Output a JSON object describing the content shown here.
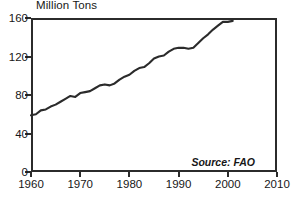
{
  "chart_data": {
    "type": "line",
    "title": "Million Tons",
    "xlabel": "",
    "ylabel": "Million Tons",
    "xlim": [
      1960,
      2010
    ],
    "ylim": [
      0,
      160
    ],
    "grid": false,
    "legend": null,
    "annotations": [
      {
        "name": "source",
        "text": "Source: FAO",
        "position": "bottom-right",
        "style": "italic"
      }
    ],
    "xticks": [
      1960,
      1970,
      1980,
      1990,
      2000,
      2010
    ],
    "yticks": [
      0,
      40,
      80,
      120,
      160
    ],
    "xtick_labels": [
      "1960",
      "1970",
      "1980",
      "1990",
      "2000",
      "2010"
    ],
    "ytick_labels": [
      "0",
      "40",
      "80",
      "120",
      "160"
    ],
    "series": [
      {
        "name": "World Fish Catch",
        "color": "#2b2b2b",
        "x": [
          1960,
          1961,
          1962,
          1963,
          1964,
          1965,
          1966,
          1967,
          1968,
          1969,
          1970,
          1971,
          1972,
          1973,
          1974,
          1975,
          1976,
          1977,
          1978,
          1979,
          1980,
          1981,
          1982,
          1983,
          1984,
          1985,
          1986,
          1987,
          1988,
          1989,
          1990,
          1991,
          1992,
          1993,
          1994,
          1995,
          1996,
          1997,
          1998,
          1999,
          2000,
          2001
        ],
        "values": [
          59,
          60,
          64,
          65,
          68,
          70,
          73,
          76,
          79,
          78,
          82,
          83,
          84,
          87,
          90,
          91,
          90,
          92,
          96,
          99,
          101,
          105,
          108,
          109,
          113,
          118,
          120,
          121,
          125,
          128,
          129,
          129,
          128,
          129,
          134,
          139,
          143,
          148,
          152,
          156,
          156,
          157
        ]
      }
    ]
  }
}
